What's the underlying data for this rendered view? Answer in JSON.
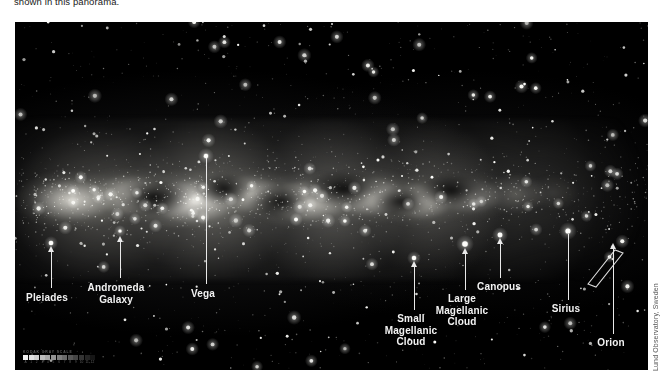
{
  "caption": {
    "text": "shown in this panorama."
  },
  "panel": {
    "name": "milky-way-panorama",
    "background_color": "#000000",
    "page_background": "#ffffff"
  },
  "credit": {
    "text": "Lund Observatory, Sweden"
  },
  "calibration": {
    "caption": "KODAK  GRAY  SCALE",
    "numbers": [
      "A",
      "1",
      "2",
      "3",
      "4",
      "5",
      "6",
      "7",
      "8",
      "9",
      "10",
      "11",
      "12"
    ],
    "swatches": [
      "#f2f2f2",
      "#e2e2e2",
      "#d0d0d0",
      "#bdbdbd",
      "#a8a8a8",
      "#939393",
      "#7e7e7e",
      "#6a6a6a",
      "#575757",
      "#454545",
      "#343434",
      "#252525",
      "#161616"
    ]
  },
  "annotations": [
    {
      "id": "pleiades",
      "label": "Pleiades",
      "label_x": 47,
      "label_y": 292,
      "line_x": 51,
      "line_top": 250,
      "line_height": 38,
      "arrow": true,
      "arrow_x": 47.5,
      "arrow_y": 246
    },
    {
      "id": "andromeda-galaxy",
      "label": "Andromeda\nGalaxy",
      "label_x": 116,
      "label_y": 282,
      "line_x": 120,
      "line_top": 240,
      "line_height": 38,
      "arrow": true,
      "arrow_x": 116.5,
      "arrow_y": 236
    },
    {
      "id": "vega",
      "label": "Vega",
      "label_x": 203,
      "label_y": 288,
      "line_x": 206,
      "line_top": 158,
      "line_height": 126,
      "arrow": false,
      "arrow_x": 0,
      "arrow_y": 0
    },
    {
      "id": "small-magellanic-cloud",
      "label": "Small\nMagellanic\nCloud",
      "label_x": 411,
      "label_y": 313,
      "line_x": 414,
      "line_top": 266,
      "line_height": 44,
      "arrow": true,
      "arrow_x": 410.5,
      "arrow_y": 261
    },
    {
      "id": "large-magellanic-cloud",
      "label": "Large\nMagellanic\nCloud",
      "label_x": 462,
      "label_y": 293,
      "line_x": 465,
      "line_top": 253,
      "line_height": 37,
      "arrow": true,
      "arrow_x": 461.5,
      "arrow_y": 248
    },
    {
      "id": "canopus",
      "label": "Canopus",
      "label_x": 499,
      "label_y": 281,
      "line_x": 500,
      "line_top": 243,
      "line_height": 35,
      "arrow": true,
      "arrow_x": 496.5,
      "arrow_y": 238
    },
    {
      "id": "sirius",
      "label": "Sirius",
      "label_x": 566,
      "label_y": 303,
      "line_x": 568,
      "line_top": 234,
      "line_height": 66,
      "arrow": false,
      "arrow_x": 0,
      "arrow_y": 0
    },
    {
      "id": "orion",
      "label": "Orion",
      "label_x": 611,
      "label_y": 337,
      "line_x": 613,
      "line_top": 248,
      "line_height": 86,
      "arrow": true,
      "arrow_x": 609.5,
      "arrow_y": 243
    }
  ]
}
